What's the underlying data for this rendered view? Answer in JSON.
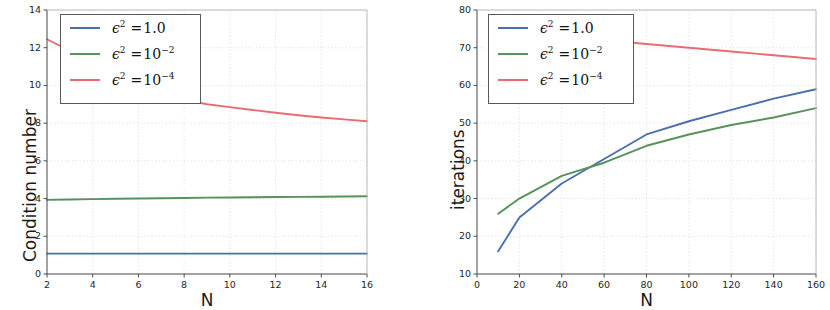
{
  "figure": {
    "background": "#ffffff",
    "width": 823,
    "height": 310
  },
  "colors": {
    "series_1": "#4a6fb0",
    "series_2": "#57915c",
    "series_3": "#ea6b72",
    "axis": "#4d4d4d",
    "grid": "#d8d8d8",
    "text": "#1a1a1a"
  },
  "legend_labels": {
    "eps_symbol": "ϵ",
    "exp_2": "2",
    "equals": "=",
    "value_1": "1.0",
    "value_2_base": "10",
    "value_2_exp": "−2",
    "value_3_base": "10",
    "value_3_exp": "−4"
  },
  "chart_data": [
    {
      "id": "condition-number-plot",
      "type": "line",
      "title": "",
      "xlabel": "N",
      "ylabel": "Condition number",
      "xlim": [
        2,
        16
      ],
      "ylim": [
        0,
        14
      ],
      "xticks": [
        2,
        4,
        6,
        8,
        10,
        12,
        14,
        16
      ],
      "yticks": [
        0,
        2,
        4,
        6,
        8,
        10,
        12,
        14
      ],
      "grid": true,
      "legend_position": "upper left",
      "series": [
        {
          "name": "ϵ² =1.0",
          "color": "#4a6fb0",
          "x": [
            2,
            3,
            4,
            5,
            6,
            7,
            8,
            9,
            10,
            11,
            12,
            13,
            14,
            15,
            16
          ],
          "values": [
            1.08,
            1.08,
            1.08,
            1.08,
            1.08,
            1.08,
            1.08,
            1.08,
            1.08,
            1.08,
            1.08,
            1.08,
            1.08,
            1.08,
            1.08
          ]
        },
        {
          "name": "ϵ² =10⁻²",
          "color": "#57915c",
          "x": [
            2,
            3,
            4,
            5,
            6,
            7,
            8,
            9,
            10,
            11,
            12,
            13,
            14,
            15,
            16
          ],
          "values": [
            3.93,
            3.95,
            3.97,
            3.99,
            4.0,
            4.02,
            4.03,
            4.05,
            4.06,
            4.07,
            4.08,
            4.09,
            4.1,
            4.11,
            4.12
          ]
        },
        {
          "name": "ϵ² =10⁻⁴",
          "color": "#ea6b72",
          "x": [
            2,
            3,
            4,
            5,
            6,
            7,
            8,
            9,
            10,
            11,
            12,
            13,
            14,
            15,
            16
          ],
          "values": [
            12.45,
            11.85,
            11.25,
            10.7,
            10.2,
            9.7,
            9.25,
            9.0,
            8.85,
            8.7,
            8.55,
            8.42,
            8.3,
            8.2,
            8.1
          ]
        }
      ]
    },
    {
      "id": "iterations-plot",
      "type": "line",
      "title": "",
      "xlabel": "N",
      "ylabel": "iterations",
      "xlim": [
        0,
        160
      ],
      "ylim": [
        10,
        80
      ],
      "xticks": [
        0,
        20,
        40,
        60,
        80,
        100,
        120,
        140,
        160
      ],
      "yticks": [
        10,
        20,
        30,
        40,
        50,
        60,
        70,
        80
      ],
      "grid": true,
      "legend_position": "upper left",
      "series": [
        {
          "name": "ϵ² =1.0",
          "color": "#4a6fb0",
          "x": [
            10,
            20,
            40,
            60,
            80,
            100,
            120,
            140,
            160
          ],
          "values": [
            16,
            25,
            34,
            40.5,
            47,
            50.5,
            53.5,
            56.5,
            59
          ]
        },
        {
          "name": "ϵ² =10⁻²",
          "color": "#57915c",
          "x": [
            10,
            20,
            40,
            60,
            80,
            100,
            120,
            140,
            160
          ],
          "values": [
            26,
            30,
            36,
            39.5,
            44,
            47,
            49.5,
            51.5,
            54
          ]
        },
        {
          "name": "ϵ² =10⁻⁴",
          "color": "#ea6b72",
          "x": [
            72,
            80,
            100,
            120,
            140,
            160
          ],
          "values": [
            71.4,
            71,
            70,
            69,
            68,
            67
          ]
        }
      ]
    }
  ]
}
